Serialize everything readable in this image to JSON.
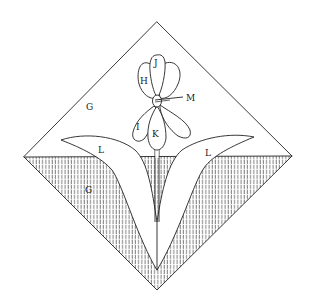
{
  "figure": {
    "type": "botanical-diagram",
    "colors": {
      "ink": "#222222",
      "background": "#ffffff"
    },
    "labels": {
      "air_region": "G",
      "ground_region": "G",
      "petal_upper_left": "H",
      "petal_top": "J",
      "petal_lower_left": "I",
      "petal_lower_center": "K",
      "center_pointer": "M",
      "leaf_left": "L",
      "leaf_right": "L"
    }
  }
}
